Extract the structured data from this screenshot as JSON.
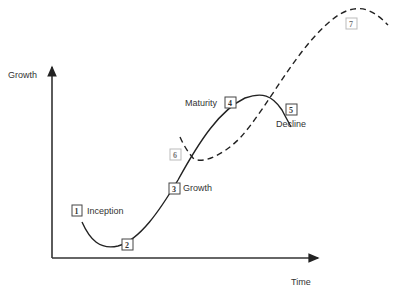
{
  "diagram": {
    "type": "business-lifecycle-s-curve",
    "y_axis_label": "Growth",
    "x_axis_label": "Time",
    "stages": [
      {
        "number": "1",
        "label": "Inception"
      },
      {
        "number": "2",
        "label": ""
      },
      {
        "number": "3",
        "label": "Growth"
      },
      {
        "number": "4",
        "label": "Maturity"
      },
      {
        "number": "5",
        "label": "Decline"
      },
      {
        "number": "6",
        "label": ""
      },
      {
        "number": "7",
        "label": ""
      }
    ],
    "colors": {
      "line": "#222222",
      "text": "#333333",
      "box_border": "#444444",
      "faint_box_border": "#bbbbbb"
    }
  }
}
